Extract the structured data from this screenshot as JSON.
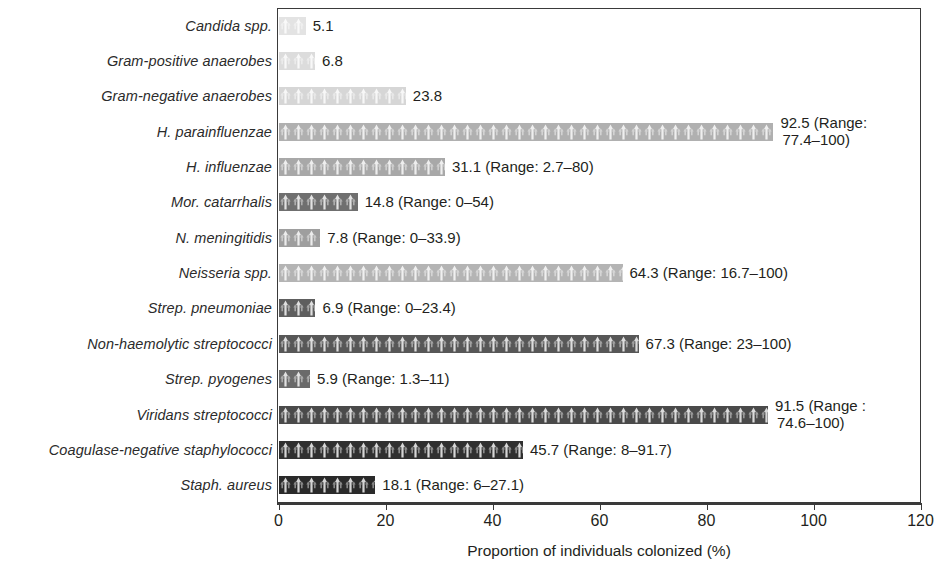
{
  "chart_data": {
    "type": "bar",
    "orientation": "horizontal",
    "title": "",
    "xlabel": "Proportion of individuals colonized (%)",
    "ylabel": "",
    "xlim": [
      0,
      120
    ],
    "xticks": [
      0,
      20,
      40,
      60,
      80,
      100,
      120
    ],
    "xtick_labels": [
      "0",
      "20",
      "40",
      "60",
      "80",
      "100",
      "120"
    ],
    "grid": false,
    "legend": null,
    "categories": [
      "Candida spp.",
      "Gram-positive anaerobes",
      "Gram-negative anaerobes",
      "H. parainfluenzae",
      "H. influenzae",
      "Mor. catarrhalis",
      "N. meningitidis",
      "Neisseria spp.",
      "Strep. pneumoniae",
      "Non-haemolytic streptococci",
      "Strep. pyogenes",
      "Viridans streptococci",
      "Coagulase-negative staphylococci",
      "Staph. aureus"
    ],
    "values": [
      5.1,
      6.8,
      23.8,
      92.5,
      31.1,
      14.8,
      7.8,
      64.3,
      6.9,
      67.3,
      5.9,
      91.5,
      45.7,
      18.1
    ],
    "bars": [
      {
        "category": "Candida spp.",
        "value": 5.1,
        "range": null,
        "label": "5.1",
        "label_lines": [
          "5.1"
        ],
        "color": "#e3e3e3"
      },
      {
        "category": "Gram-positive anaerobes",
        "value": 6.8,
        "range": null,
        "label": "6.8",
        "label_lines": [
          "6.8"
        ],
        "color": "#dcdcdc"
      },
      {
        "category": "Gram-negative anaerobes",
        "value": 23.8,
        "range": null,
        "label": "23.8",
        "label_lines": [
          "23.8"
        ],
        "color": "#d6d6d6"
      },
      {
        "category": "H. parainfluenzae",
        "value": 92.5,
        "range": "77.4–100",
        "label": "92.5 (Range: 77.4–100)",
        "label_lines": [
          "92.5 (Range:",
          "77.4–100)"
        ],
        "color": "#b0b0b0"
      },
      {
        "category": "H. influenzae",
        "value": 31.1,
        "range": "2.7–80",
        "label": "31.1 (Range: 2.7–80)",
        "label_lines": [
          "31.1 (Range: 2.7–80)"
        ],
        "color": "#a8a8a8"
      },
      {
        "category": "Mor. catarrhalis",
        "value": 14.8,
        "range": "0–54",
        "label": "14.8 (Range: 0–54)",
        "label_lines": [
          "14.8 (Range: 0–54)"
        ],
        "color": "#6f6f6f"
      },
      {
        "category": "N. meningitidis",
        "value": 7.8,
        "range": "0–33.9",
        "label": "7.8 (Range: 0–33.9)",
        "label_lines": [
          "7.8 (Range: 0–33.9)"
        ],
        "color": "#9e9e9e"
      },
      {
        "category": "Neisseria spp.",
        "value": 64.3,
        "range": "16.7–100",
        "label": "64.3 (Range: 16.7–100)",
        "label_lines": [
          "64.3 (Range: 16.7–100)"
        ],
        "color": "#b4b4b4"
      },
      {
        "category": "Strep. pneumoniae",
        "value": 6.9,
        "range": "0–23.4",
        "label": "6.9 (Range: 0–23.4)",
        "label_lines": [
          "6.9 (Range: 0–23.4)"
        ],
        "color": "#5e5e5e"
      },
      {
        "category": "Non-haemolytic streptococci",
        "value": 67.3,
        "range": "23–100",
        "label": "67.3 (Range: 23–100)",
        "label_lines": [
          "67.3 (Range: 23–100)"
        ],
        "color": "#575757"
      },
      {
        "category": "Strep. pyogenes",
        "value": 5.9,
        "range": "1.3–11",
        "label": "5.9 (Range: 1.3–11)",
        "label_lines": [
          "5.9 (Range: 1.3–11)"
        ],
        "color": "#6a6a6a"
      },
      {
        "category": "Viridans streptococci",
        "value": 91.5,
        "range": "74.6–100",
        "label": "91.5 (Range : 74.6–100)",
        "label_lines": [
          "91.5 (Range :",
          "74.6–100)"
        ],
        "color": "#4a4a4a"
      },
      {
        "category": "Coagulase-negative staphylococci",
        "value": 45.7,
        "range": "8–91.7",
        "label": "45.7 (Range: 8–91.7)",
        "label_lines": [
          "45.7 (Range: 8–91.7)"
        ],
        "color": "#303030"
      },
      {
        "category": "Staph. aureus",
        "value": 18.1,
        "range": "6–27.1",
        "label": "18.1 (Range: 6–27.1)",
        "label_lines": [
          "18.1 (Range: 6–27.1)"
        ],
        "color": "#2a2a2a"
      }
    ]
  },
  "axis": {
    "title": "Proportion of individuals colonized (%)",
    "ticks": [
      "0",
      "20",
      "40",
      "60",
      "80",
      "100",
      "120"
    ]
  },
  "style": {
    "frame_color": "#3a3a3a",
    "text_color": "#231f20",
    "background": "#ffffff"
  }
}
